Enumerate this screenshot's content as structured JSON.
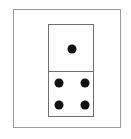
{
  "figure": {
    "background_color": "#ffffff",
    "frame": {
      "name": "outer-frame",
      "stroke_color": "#9a9a9a",
      "stroke_width": 1,
      "x": 13,
      "y": 9,
      "width": 108,
      "height": 119
    },
    "tile": {
      "name": "domino-tile",
      "stroke_color": "#6e6e6e",
      "stroke_width": 1,
      "fill_color": "#ffffff",
      "x": 48,
      "y": 24,
      "width": 46,
      "height": 93,
      "divider_y": 71,
      "orientation": "vertical",
      "pip_color": "#111111",
      "pip_diameter": 9,
      "total_pips": 5,
      "notation": "1-4",
      "halves": [
        {
          "name": "top-half",
          "pip_count": 1,
          "pip_layout": "center",
          "pips": [
            {
              "name": "pip-center",
              "cx": 23,
              "cy": 24
            }
          ]
        },
        {
          "name": "bottom-half",
          "pip_count": 4,
          "pip_layout": "four-corners",
          "pips": [
            {
              "name": "pip-top-left",
              "cx": 10,
              "cy": 11
            },
            {
              "name": "pip-top-right",
              "cx": 36,
              "cy": 11
            },
            {
              "name": "pip-bottom-left",
              "cx": 10,
              "cy": 33
            },
            {
              "name": "pip-bottom-right",
              "cx": 36,
              "cy": 33
            }
          ]
        }
      ]
    }
  }
}
